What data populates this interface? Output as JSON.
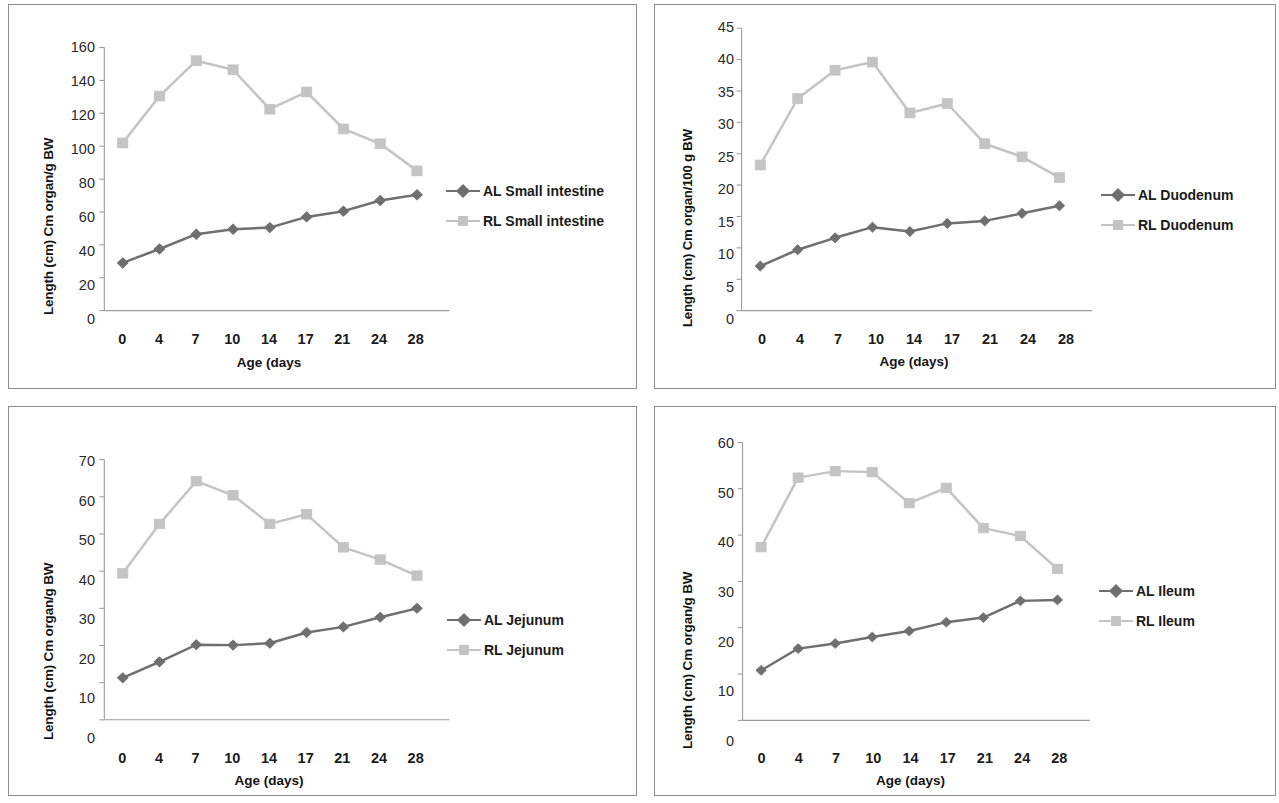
{
  "figure": {
    "panel_count": 4,
    "series_colors": {
      "AL": "#6f6f6f",
      "RL": "#c4c4c4"
    },
    "axis_color": "#9a9a9a",
    "panel_border_color": "#8d8d8d"
  },
  "chart_data": [
    {
      "id": "small-intestine",
      "type": "line",
      "title": "",
      "xlabel": "Age (days",
      "ylabel": "Length (cm)  Cm organ/g BW",
      "categories": [
        "0",
        "4",
        "7",
        "10",
        "14",
        "17",
        "21",
        "24",
        "28"
      ],
      "ylim": [
        0,
        160
      ],
      "yticks": [
        0,
        20,
        40,
        60,
        80,
        100,
        120,
        140,
        160
      ],
      "grid": false,
      "legend_position": "right",
      "series": [
        {
          "name": "AL Small intestine",
          "marker": "diamond",
          "color": "#6f6f6f",
          "values": [
            29,
            37.5,
            46.5,
            49.5,
            50.5,
            57,
            60.5,
            67,
            70.5
          ]
        },
        {
          "name": "RL Small intestine",
          "marker": "square",
          "color": "#c4c4c4",
          "values": [
            102,
            130.5,
            152,
            146.5,
            122.5,
            133,
            110.5,
            101.5,
            85
          ]
        }
      ]
    },
    {
      "id": "duodenum",
      "type": "line",
      "title": "",
      "xlabel": "Age (days)",
      "ylabel": "Length (cm)  Cm organ/100 g BW",
      "categories": [
        "0",
        "4",
        "7",
        "10",
        "14",
        "17",
        "21",
        "24",
        "28"
      ],
      "ylim": [
        0,
        45
      ],
      "yticks": [
        0,
        5,
        10,
        15,
        20,
        25,
        30,
        35,
        40,
        45
      ],
      "grid": false,
      "legend_position": "right",
      "series": [
        {
          "name": "AL Duodenum",
          "marker": "diamond",
          "color": "#6f6f6f",
          "values": [
            7.1,
            9.7,
            11.6,
            13.3,
            12.6,
            13.9,
            14.3,
            15.5,
            16.7
          ]
        },
        {
          "name": "RL Duodenum",
          "marker": "square",
          "color": "#c4c4c4",
          "values": [
            23.2,
            33.8,
            38.3,
            39.6,
            31.5,
            33.0,
            26.6,
            24.5,
            21.2
          ]
        }
      ]
    },
    {
      "id": "jejunum",
      "type": "line",
      "title": "",
      "xlabel": "Age (days)",
      "ylabel": "Length (cm) Cm organ/g BW",
      "categories": [
        "0",
        "4",
        "7",
        "10",
        "14",
        "17",
        "21",
        "24",
        "28"
      ],
      "ylim": [
        0,
        70
      ],
      "yticks": [
        0,
        10,
        20,
        30,
        40,
        50,
        60,
        70
      ],
      "grid": false,
      "legend_position": "right",
      "series": [
        {
          "name": "AL Jejunum",
          "marker": "diamond",
          "color": "#6f6f6f",
          "values": [
            11.3,
            15.6,
            20.2,
            20.1,
            20.6,
            23.5,
            25.0,
            27.6,
            30.0
          ]
        },
        {
          "name": "RL  Jejunum",
          "marker": "square",
          "color": "#c4c4c4",
          "values": [
            39.4,
            52.7,
            64.2,
            60.4,
            52.7,
            55.3,
            46.4,
            43.1,
            38.8
          ]
        }
      ]
    },
    {
      "id": "ileum",
      "type": "line",
      "title": "",
      "xlabel": "Age (days)",
      "ylabel": "Length (cm) Cm organ/g BW",
      "categories": [
        "0",
        "4",
        "7",
        "10",
        "14",
        "17",
        "21",
        "24",
        "28"
      ],
      "ylim": [
        0,
        60
      ],
      "yticks": [
        0,
        10,
        20,
        30,
        40,
        50,
        60
      ],
      "grid": false,
      "legend_position": "right",
      "series": [
        {
          "name": "AL Ileum",
          "marker": "diamond",
          "color": "#6f6f6f",
          "values": [
            10.8,
            15.5,
            16.6,
            18.0,
            19.3,
            21.2,
            22.2,
            25.8,
            26.0
          ]
        },
        {
          "name": "RL Ileum",
          "marker": "square",
          "color": "#c4c4c4",
          "values": [
            37.4,
            52.4,
            53.8,
            53.6,
            46.9,
            50.2,
            41.5,
            39.8,
            32.7
          ]
        }
      ]
    }
  ]
}
